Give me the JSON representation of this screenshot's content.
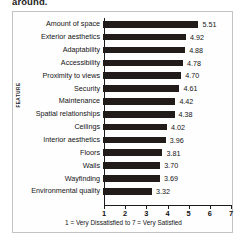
{
  "document": {
    "clipped_text_above": "around."
  },
  "chart_data": {
    "type": "bar",
    "orientation": "horizontal",
    "title": "",
    "xlabel": "1 = Very Dissatisfied to 7 = Very Satisfied",
    "ylabel": "FEATURE",
    "xlim": [
      1,
      7
    ],
    "xticks": [
      1,
      2,
      3,
      4,
      5,
      6,
      7
    ],
    "xtick_labels": [
      "1",
      "2",
      "3",
      "4",
      "5",
      "6",
      "7"
    ],
    "grid": false,
    "legend": null,
    "bar_color": "#211c19",
    "axis_color": "#1b1b1b",
    "categories": [
      "Amount of space",
      "Exterior aesthetics",
      "Adaptability",
      "Accessibility",
      "Proximity to views",
      "Security",
      "Maintenance",
      "Spatial relationships",
      "Ceilings",
      "Interior aesthetics",
      "Floors",
      "Walls",
      "Wayfinding",
      "Environmental quality"
    ],
    "values": [
      5.51,
      4.92,
      4.88,
      4.78,
      4.7,
      4.61,
      4.42,
      4.38,
      4.02,
      3.96,
      3.81,
      3.7,
      3.69,
      3.32
    ],
    "value_labels": [
      "5.51",
      "4.92",
      "4.88",
      "4.78",
      "4.70",
      "4.61",
      "4.42",
      "4.38",
      "4.02",
      "3.96",
      "3.81",
      "3.70",
      "3.69",
      "3.32"
    ]
  }
}
